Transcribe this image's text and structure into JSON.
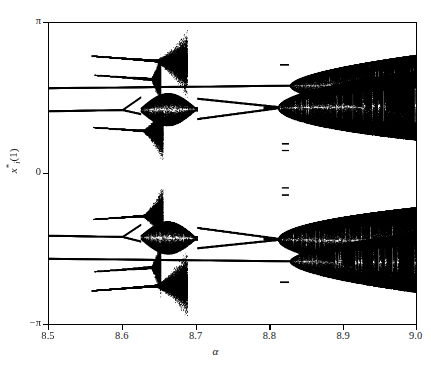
{
  "figure": {
    "background_color": "#ffffff",
    "ink_color": "#000000"
  },
  "axes": {
    "x_title": "α",
    "y_title_base": "x",
    "y_title_star": "*",
    "y_title_sub": "i",
    "y_title_arg": "(1)",
    "x_ticks": [
      "8.5",
      "8.6",
      "8.7",
      "8.8",
      "8.9",
      "9.0"
    ],
    "y_ticks": [
      "π",
      "0",
      "−π"
    ]
  },
  "chart_data": {
    "type": "scatter",
    "title": "",
    "subtitle": "",
    "xlabel": "α",
    "ylabel": "x*_i(1)",
    "xlim": [
      8.5,
      9.0
    ],
    "ylim": [
      -3.14159,
      3.14159
    ],
    "ylim_labels": [
      "-π",
      "π"
    ],
    "xticks": [
      8.5,
      8.6,
      8.7,
      8.8,
      8.9,
      9.0
    ],
    "yticks": [
      3.14159,
      0,
      -3.14159
    ],
    "ytick_labels": [
      "π",
      "0",
      "-π"
    ],
    "grid": false,
    "legend": null,
    "point_color": "#000000",
    "series": [
      {
        "name": "branch-upper-outer-1",
        "kind": "segment-band",
        "y_start": 2.45,
        "y_end": 2.3,
        "x_start": 8.558,
        "x_end": 8.688,
        "thickness": 0.035,
        "chaotic_from": 8.648,
        "terminates": true
      },
      {
        "name": "branch-upper-outer-2",
        "kind": "segment-band",
        "y_start": 2.05,
        "y_end": 1.95,
        "x_start": 8.562,
        "x_end": 8.652,
        "thickness": 0.03,
        "chaotic_from": 8.64,
        "terminates": true
      },
      {
        "name": "branch-upper-main-1",
        "kind": "continuous-band",
        "y_start": 1.78,
        "y_end": 1.86,
        "x_start": 8.5,
        "x_end": 9.0,
        "thickness": 0.04,
        "chaotic_from": 8.828,
        "chaos_spread_at_end": 0.62
      },
      {
        "name": "branch-upper-main-2",
        "kind": "cascade-band",
        "y_start": 1.3,
        "y_end": 1.42,
        "x_start": 8.5,
        "x_end": 9.0,
        "thickness": 0.04,
        "first_split": 8.6,
        "window_start": 8.625,
        "window_end": 8.702,
        "chaotic_from": 8.812,
        "chaos_spread_at_end": 0.72
      },
      {
        "name": "branch-upper-inner",
        "kind": "segment-band",
        "y_start": 0.96,
        "y_end": 0.86,
        "x_start": 8.56,
        "x_end": 8.655,
        "thickness": 0.03,
        "chaotic_from": 8.63,
        "terminates": true
      },
      {
        "name": "isolated-dash-upper-far",
        "kind": "dash",
        "x": 8.815,
        "y": 2.27,
        "length": 0.012,
        "thickness": 0.035
      },
      {
        "name": "isolated-dash-upper-a",
        "kind": "dash",
        "x": 8.817,
        "y": 0.62,
        "length": 0.01,
        "thickness": 0.03
      },
      {
        "name": "isolated-dash-upper-b",
        "kind": "dash",
        "x": 8.817,
        "y": 0.48,
        "length": 0.01,
        "thickness": 0.03
      },
      {
        "name": "isolated-dash-lower-a",
        "kind": "dash",
        "x": 8.817,
        "y": -0.3,
        "length": 0.01,
        "thickness": 0.03
      },
      {
        "name": "isolated-dash-lower-b",
        "kind": "dash",
        "x": 8.817,
        "y": -0.45,
        "length": 0.01,
        "thickness": 0.03
      },
      {
        "name": "branch-lower-inner",
        "kind": "segment-band",
        "y_start": -0.96,
        "y_end": -0.86,
        "x_start": 8.56,
        "x_end": 8.655,
        "thickness": 0.03,
        "chaotic_from": 8.63,
        "terminates": true
      },
      {
        "name": "branch-lower-main-2",
        "kind": "cascade-band",
        "y_start": -1.3,
        "y_end": -1.42,
        "x_start": 8.5,
        "x_end": 9.0,
        "thickness": 0.04,
        "first_split": 8.6,
        "window_start": 8.625,
        "window_end": 8.702,
        "chaotic_from": 8.812,
        "chaos_spread_at_end": 0.72
      },
      {
        "name": "branch-lower-main-1",
        "kind": "continuous-band",
        "y_start": -1.78,
        "y_end": -1.86,
        "x_start": 8.5,
        "x_end": 9.0,
        "thickness": 0.04,
        "chaotic_from": 8.828,
        "chaos_spread_at_end": 0.62
      },
      {
        "name": "isolated-dash-lower-far",
        "kind": "dash",
        "x": 8.815,
        "y": -2.27,
        "length": 0.012,
        "thickness": 0.035
      },
      {
        "name": "branch-lower-outer-2",
        "kind": "segment-band",
        "y_start": -2.05,
        "y_end": -1.95,
        "x_start": 8.562,
        "x_end": 8.652,
        "thickness": 0.03,
        "chaotic_from": 8.64,
        "terminates": true
      },
      {
        "name": "branch-lower-outer-1",
        "kind": "segment-band",
        "y_start": -2.45,
        "y_end": -2.3,
        "x_start": 8.558,
        "x_end": 8.688,
        "thickness": 0.035,
        "chaotic_from": 8.648,
        "terminates": true
      }
    ]
  }
}
